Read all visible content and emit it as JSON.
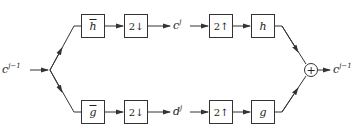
{
  "diagram": {
    "type": "two-channel filter bank (wavelet analysis/synthesis)",
    "input": {
      "base": "c",
      "sup": "j−1"
    },
    "output": {
      "base": "c",
      "sup": "j−1"
    },
    "top_branch": {
      "analysis_filter": "h",
      "downsample": "2↓",
      "signal": {
        "base": "c",
        "sup": "j"
      },
      "upsample": "2↑",
      "synthesis_filter": "h"
    },
    "bottom_branch": {
      "analysis_filter": "g",
      "downsample": "2↓",
      "signal": {
        "base": "d",
        "sup": "j"
      },
      "upsample": "2↑",
      "synthesis_filter": "g"
    },
    "sum_symbol": "+"
  }
}
